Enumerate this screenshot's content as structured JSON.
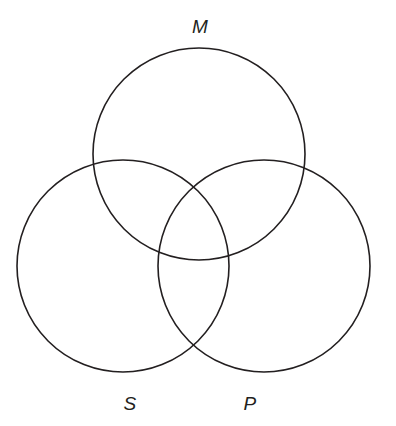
{
  "figure": {
    "kind": "venn-diagram",
    "background_color": "#ffffff",
    "stroke_color": "#231f20",
    "stroke_width": 1.6,
    "width": 396,
    "height": 426
  },
  "circles": [
    {
      "id": "M",
      "label": "M",
      "cx": 199,
      "cy": 154,
      "r": 106
    },
    {
      "id": "S",
      "label": "S",
      "cx": 123,
      "cy": 266,
      "r": 106
    },
    {
      "id": "P",
      "label": "P",
      "cx": 264,
      "cy": 266,
      "r": 106
    }
  ],
  "labels": {
    "middle_term": {
      "text": "M",
      "x": 200,
      "y": 33
    },
    "subject_term": {
      "text": "S",
      "x": 130,
      "y": 410
    },
    "predicate_term": {
      "text": "P",
      "x": 250,
      "y": 410
    }
  },
  "chart_data": {
    "type": "venn",
    "title": "",
    "sets": [
      "M",
      "S",
      "P"
    ],
    "set_labels": [
      "M",
      "S",
      "P"
    ],
    "regions": [
      "M only",
      "S only",
      "P only",
      "M∩S",
      "M∩P",
      "S∩P",
      "M∩S∩P"
    ],
    "region_values": [
      null,
      null,
      null,
      null,
      null,
      null,
      null
    ],
    "shaded_regions": [],
    "marked_regions": []
  }
}
